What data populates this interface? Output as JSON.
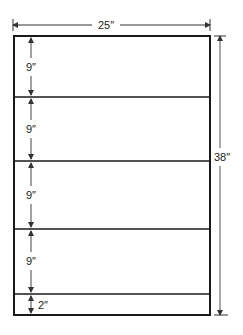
{
  "diagram": {
    "overall_width_label": "25″",
    "overall_height_label": "38″",
    "sections": [
      {
        "height_label": "9″"
      },
      {
        "height_label": "9″"
      },
      {
        "height_label": "9″"
      },
      {
        "height_label": "9″"
      },
      {
        "height_label": "2″"
      }
    ],
    "colors": {
      "line": "#1a1a1a",
      "dimension": "#444444",
      "background": "#ffffff"
    }
  }
}
